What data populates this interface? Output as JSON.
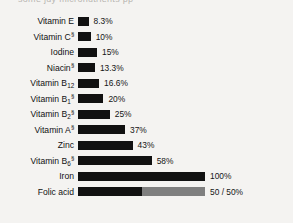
{
  "header": {
    "clipped_text": "some juy micronutrients pp"
  },
  "chart_data": {
    "type": "bar",
    "orientation": "horizontal",
    "title": "",
    "xlabel": "",
    "ylabel": "",
    "xlim": [
      0,
      100
    ],
    "grid": false,
    "legend": false,
    "colors": {
      "bar": "#111111",
      "bar_secondary": "#7f7f7f",
      "background": "#f4f3f1",
      "text": "#111111"
    },
    "categories": [
      "Vitamin E",
      "Vitamin C",
      "Iodine",
      "Niacin",
      "Vitamin B12",
      "Vitamin B1",
      "Vitamin B2",
      "Vitamin A",
      "Zinc",
      "Vitamin B6",
      "Iron",
      "Folic acid"
    ],
    "values": [
      8.3,
      10,
      15,
      13.3,
      16.6,
      20,
      25,
      37,
      43,
      58,
      100,
      100
    ],
    "value_labels": [
      "8.3%",
      "10%",
      "15%",
      "13.3%",
      "16.6%",
      "20%",
      "25%",
      "37%",
      "43%",
      "58%",
      "100%",
      "50/50%"
    ],
    "rows": [
      {
        "name": "Vitamin E",
        "base": "Vitamin E",
        "sub": "",
        "marker": "",
        "value": 8.3,
        "value_label": "8.3%",
        "segments": [
          {
            "pct": 8.3,
            "tone": "dark"
          }
        ]
      },
      {
        "name": "Vitamin C",
        "base": "Vitamin C",
        "sub": "",
        "marker": "a",
        "value": 10,
        "value_label": "10%",
        "segments": [
          {
            "pct": 10,
            "tone": "dark"
          }
        ]
      },
      {
        "name": "Iodine",
        "base": "Iodine",
        "sub": "",
        "marker": "",
        "value": 15,
        "value_label": "15%",
        "segments": [
          {
            "pct": 15,
            "tone": "dark"
          }
        ]
      },
      {
        "name": "Niacin",
        "base": "Niacin",
        "sub": "",
        "marker": "a",
        "value": 13.3,
        "value_label": "13.3%",
        "segments": [
          {
            "pct": 13.3,
            "tone": "dark"
          }
        ]
      },
      {
        "name": "Vitamin B12",
        "base": "Vitamin B",
        "sub": "12",
        "marker": "",
        "value": 16.6,
        "value_label": "16.6%",
        "segments": [
          {
            "pct": 16.6,
            "tone": "dark"
          }
        ]
      },
      {
        "name": "Vitamin B1",
        "base": "Vitamin B",
        "sub": "1",
        "marker": "a",
        "value": 20,
        "value_label": "20%",
        "segments": [
          {
            "pct": 20,
            "tone": "dark"
          }
        ]
      },
      {
        "name": "Vitamin B2",
        "base": "Vitamin B",
        "sub": "2",
        "marker": "a",
        "value": 25,
        "value_label": "25%",
        "segments": [
          {
            "pct": 25,
            "tone": "dark"
          }
        ]
      },
      {
        "name": "Vitamin A",
        "base": "Vitamin A",
        "sub": "",
        "marker": "a",
        "value": 37,
        "value_label": "37%",
        "segments": [
          {
            "pct": 37,
            "tone": "dark"
          }
        ]
      },
      {
        "name": "Zinc",
        "base": "Zinc",
        "sub": "",
        "marker": "",
        "value": 43,
        "value_label": "43%",
        "segments": [
          {
            "pct": 43,
            "tone": "dark"
          }
        ]
      },
      {
        "name": "Vitamin B6",
        "base": "Vitamin B",
        "sub": "6",
        "marker": "a",
        "value": 58,
        "value_label": "58%",
        "segments": [
          {
            "pct": 58,
            "tone": "dark"
          }
        ]
      },
      {
        "name": "Iron",
        "base": "Iron",
        "sub": "",
        "marker": "",
        "value": 100,
        "value_label": "100%",
        "segments": [
          {
            "pct": 100,
            "tone": "dark"
          }
        ]
      },
      {
        "name": "Folic acid",
        "base": "Folic acid",
        "sub": "",
        "marker": "",
        "value": 100,
        "value_label": "50 / 50%",
        "segments": [
          {
            "pct": 50,
            "tone": "dark"
          },
          {
            "pct": 50,
            "tone": "grey"
          }
        ]
      }
    ]
  }
}
